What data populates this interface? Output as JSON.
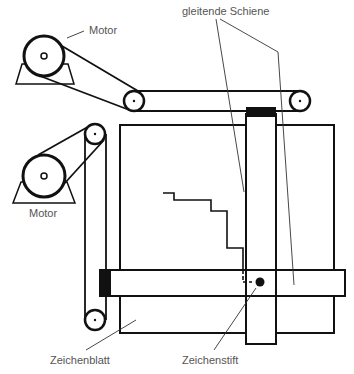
{
  "diagram": {
    "type": "plotter-mechanism",
    "labels": {
      "motor_top": "Motor",
      "motor_left": "Motor",
      "sliding_rail": "gleitende Schiene",
      "drawing_sheet": "Zeichenblatt",
      "pen": "Zeichenstift"
    },
    "colors": {
      "line": "#111111",
      "label": "#555555",
      "background": "#ffffff"
    }
  }
}
